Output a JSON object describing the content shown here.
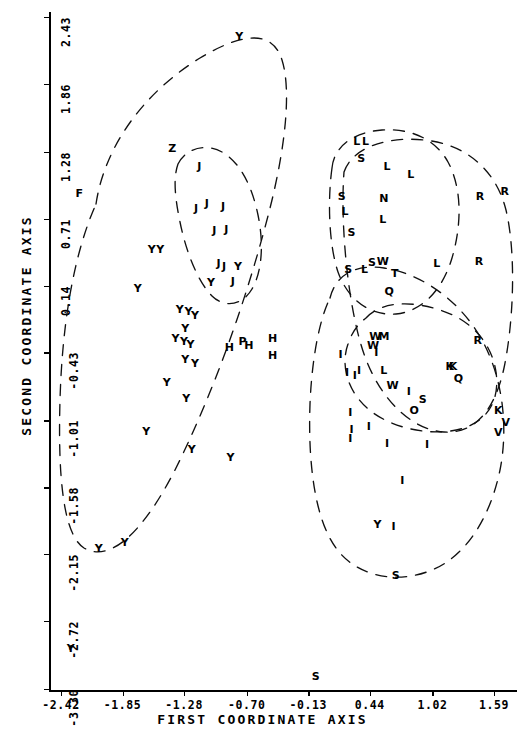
{
  "chart_data": {
    "type": "scatter",
    "title": "",
    "xlabel": "FIRST COORDINATE AXIS",
    "ylabel": "SECOND COORDINATE AXIS",
    "xticks": [
      "-2.42",
      "-1.85",
      "-1.28",
      "-0.70",
      "-0.13",
      "0.44",
      "1.02",
      "1.59"
    ],
    "xtick_values": [
      -2.42,
      -1.85,
      -1.28,
      -0.7,
      -0.13,
      0.44,
      1.02,
      1.59
    ],
    "yticks": [
      "2.43",
      "1.86",
      "1.28",
      "0.71",
      "0.14",
      "-0.43",
      "-1.01",
      "-1.58",
      "-2.15",
      "-2.72",
      "-3.30"
    ],
    "ytick_values": [
      2.43,
      1.86,
      1.28,
      0.71,
      0.14,
      -0.43,
      -1.01,
      -1.58,
      -2.15,
      -2.72,
      -3.3
    ],
    "xlim": [
      -2.42,
      1.88
    ],
    "ylim": [
      -3.3,
      2.43
    ],
    "grid": false,
    "legend": "none",
    "marker_style": "letter-code",
    "points": [
      {
        "label": "Y",
        "x": -0.77,
        "y": 2.27
      },
      {
        "label": "Z",
        "x": -1.39,
        "y": 1.31
      },
      {
        "label": "J",
        "x": -1.14,
        "y": 1.16
      },
      {
        "label": "F",
        "x": -2.25,
        "y": 0.93
      },
      {
        "label": "J",
        "x": -1.17,
        "y": 0.8
      },
      {
        "label": "J",
        "x": -1.07,
        "y": 0.84
      },
      {
        "label": "J",
        "x": -0.92,
        "y": 0.82
      },
      {
        "label": "J",
        "x": -1.0,
        "y": 0.61
      },
      {
        "label": "J",
        "x": -0.89,
        "y": 0.62
      },
      {
        "label": "Y",
        "x": -1.58,
        "y": 0.45
      },
      {
        "label": "Y",
        "x": -1.5,
        "y": 0.45
      },
      {
        "label": "J",
        "x": -0.96,
        "y": 0.33
      },
      {
        "label": "J",
        "x": -0.91,
        "y": 0.31
      },
      {
        "label": "Y",
        "x": -0.78,
        "y": 0.31
      },
      {
        "label": "Y",
        "x": -1.03,
        "y": 0.17
      },
      {
        "label": "J",
        "x": -0.83,
        "y": 0.18
      },
      {
        "label": "Y",
        "x": -1.71,
        "y": 0.12
      },
      {
        "label": "Y",
        "x": -1.32,
        "y": -0.06
      },
      {
        "label": "Y",
        "x": -1.24,
        "y": -0.08
      },
      {
        "label": "Y",
        "x": -1.18,
        "y": -0.11
      },
      {
        "label": "Y",
        "x": -1.27,
        "y": -0.22
      },
      {
        "label": "Y",
        "x": -1.36,
        "y": -0.31
      },
      {
        "label": "Y",
        "x": -1.28,
        "y": -0.33
      },
      {
        "label": "Y",
        "x": -1.22,
        "y": -0.36
      },
      {
        "label": "H",
        "x": -0.86,
        "y": -0.38
      },
      {
        "label": "P",
        "x": -0.74,
        "y": -0.33
      },
      {
        "label": "H",
        "x": -0.68,
        "y": -0.37
      },
      {
        "label": "H",
        "x": -0.46,
        "y": -0.31
      },
      {
        "label": "H",
        "x": -0.46,
        "y": -0.45
      },
      {
        "label": "Y",
        "x": -1.27,
        "y": -0.49
      },
      {
        "label": "Y",
        "x": -1.18,
        "y": -0.52
      },
      {
        "label": "Y",
        "x": -1.44,
        "y": -0.68
      },
      {
        "label": "Y",
        "x": -1.26,
        "y": -0.82
      },
      {
        "label": "Y",
        "x": -1.63,
        "y": -1.1
      },
      {
        "label": "Y",
        "x": -1.21,
        "y": -1.25
      },
      {
        "label": "Y",
        "x": -0.85,
        "y": -1.32
      },
      {
        "label": "Y",
        "x": -2.07,
        "y": -2.1
      },
      {
        "label": "Y",
        "x": -1.83,
        "y": -2.05
      },
      {
        "label": "Y",
        "x": -2.33,
        "y": -2.95
      },
      {
        "label": "L",
        "x": 0.32,
        "y": 1.37
      },
      {
        "label": "L",
        "x": 0.4,
        "y": 1.37
      },
      {
        "label": "S",
        "x": 0.36,
        "y": 1.23
      },
      {
        "label": "L",
        "x": 0.6,
        "y": 1.16
      },
      {
        "label": "L",
        "x": 0.82,
        "y": 1.09
      },
      {
        "label": "S",
        "x": 0.18,
        "y": 0.9
      },
      {
        "label": "N",
        "x": 0.57,
        "y": 0.89
      },
      {
        "label": "R",
        "x": 1.46,
        "y": 0.9
      },
      {
        "label": "R",
        "x": 1.69,
        "y": 0.95
      },
      {
        "label": "L",
        "x": 0.21,
        "y": 0.78
      },
      {
        "label": "L",
        "x": 0.56,
        "y": 0.71
      },
      {
        "label": "S",
        "x": 0.27,
        "y": 0.6
      },
      {
        "label": "S",
        "x": 0.46,
        "y": 0.34
      },
      {
        "label": "W",
        "x": 0.56,
        "y": 0.35
      },
      {
        "label": "L",
        "x": 1.06,
        "y": 0.33
      },
      {
        "label": "R",
        "x": 1.45,
        "y": 0.35
      },
      {
        "label": "S",
        "x": 0.24,
        "y": 0.28
      },
      {
        "label": "L",
        "x": 0.39,
        "y": 0.28
      },
      {
        "label": "T",
        "x": 0.67,
        "y": 0.25
      },
      {
        "label": "Q",
        "x": 0.62,
        "y": 0.09
      },
      {
        "label": "W",
        "x": 0.49,
        "y": -0.29
      },
      {
        "label": "M",
        "x": 0.57,
        "y": -0.29
      },
      {
        "label": "W",
        "x": 0.47,
        "y": -0.37
      },
      {
        "label": "R",
        "x": 1.44,
        "y": -0.32
      },
      {
        "label": "I",
        "x": 0.17,
        "y": -0.44
      },
      {
        "label": "I",
        "x": 0.5,
        "y": -0.43
      },
      {
        "label": "K",
        "x": 1.18,
        "y": -0.55
      },
      {
        "label": "K",
        "x": 1.21,
        "y": -0.55
      },
      {
        "label": "L",
        "x": 0.57,
        "y": -0.58
      },
      {
        "label": "I",
        "x": 0.23,
        "y": -0.6
      },
      {
        "label": "I",
        "x": 0.3,
        "y": -0.62
      },
      {
        "label": "I",
        "x": 0.34,
        "y": -0.58
      },
      {
        "label": "Q",
        "x": 1.26,
        "y": -0.65
      },
      {
        "label": "W",
        "x": 0.65,
        "y": -0.71
      },
      {
        "label": "I",
        "x": 0.8,
        "y": -0.76
      },
      {
        "label": "S",
        "x": 0.93,
        "y": -0.83
      },
      {
        "label": "O",
        "x": 0.85,
        "y": -0.92
      },
      {
        "label": "K",
        "x": 1.63,
        "y": -0.92
      },
      {
        "label": "I",
        "x": 0.26,
        "y": -0.94
      },
      {
        "label": "V",
        "x": 1.7,
        "y": -1.02
      },
      {
        "label": "I",
        "x": 0.27,
        "y": -1.08
      },
      {
        "label": "I",
        "x": 0.43,
        "y": -1.06
      },
      {
        "label": "V",
        "x": 1.63,
        "y": -1.11
      },
      {
        "label": "I",
        "x": 0.26,
        "y": -1.16
      },
      {
        "label": "I",
        "x": 0.6,
        "y": -1.2
      },
      {
        "label": "I",
        "x": 0.97,
        "y": -1.21
      },
      {
        "label": "I",
        "x": 0.74,
        "y": -1.52
      },
      {
        "label": "Y",
        "x": 0.51,
        "y": -1.89
      },
      {
        "label": "I",
        "x": 0.66,
        "y": -1.91
      },
      {
        "label": "S",
        "x": 0.68,
        "y": -2.33
      },
      {
        "label": "S",
        "x": -0.06,
        "y": -3.19
      }
    ],
    "clusters": [
      {
        "name": "left-large-cluster"
      },
      {
        "name": "j-cluster"
      },
      {
        "name": "upper-right-cluster"
      },
      {
        "name": "right-outer-cluster"
      },
      {
        "name": "lower-right-cluster"
      },
      {
        "name": "i-cluster"
      }
    ]
  },
  "axes": {
    "x_title": "FIRST COORDINATE AXIS",
    "y_title": "SECOND COORDINATE AXIS"
  }
}
